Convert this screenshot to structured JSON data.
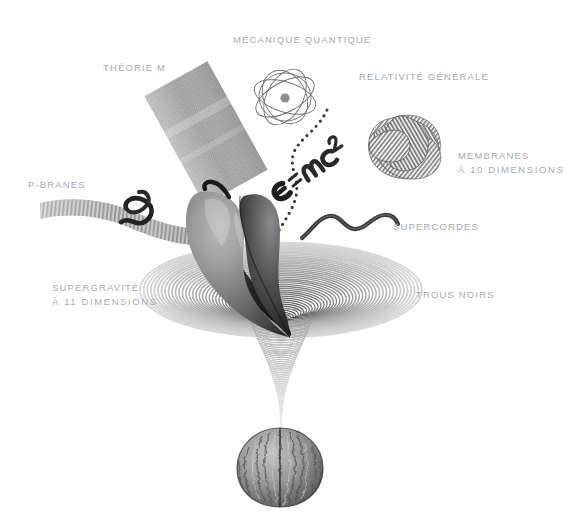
{
  "figure": {
    "type": "scientific-illustration",
    "background_color": "#ffffff",
    "label_color": "#a9a9ab"
  },
  "labels": [
    {
      "id": "theorie-m",
      "text": "THÉORIE M",
      "text2": ""
    },
    {
      "id": "mecanique",
      "text": "MÉCANIQUE QUANTIQUE",
      "text2": ""
    },
    {
      "id": "relativite",
      "text": "RELATIVITÉ GÉNÉRALE",
      "text2": ""
    },
    {
      "id": "membranes",
      "text": "MEMBRANES",
      "text2": "À 10 DIMENSIONS"
    },
    {
      "id": "p-branes",
      "text": "P-BRANES",
      "text2": ""
    },
    {
      "id": "supercordes",
      "text": "SUPERCORDES",
      "text2": ""
    },
    {
      "id": "supergravite",
      "text": "SUPERGRAVITÉ",
      "text2": "À 11 DIMENSIONS"
    },
    {
      "id": "trous-noirs",
      "text": "TROUS NOIRS",
      "text2": ""
    }
  ],
  "formula": {
    "parts": [
      "E",
      "=",
      "mc",
      "2"
    ],
    "full": "E=mc2",
    "style": "handwritten-rotated"
  },
  "objects": {
    "apple": "apple-teardrop-morph",
    "walnut": "walnut-nut",
    "knot": "striped-torus-knot",
    "atom": "atom-orbits",
    "brane_panel": "mesh-membrane-panel",
    "ribbon": "striped-ribbon-brane",
    "string": "wavy-superstring",
    "vortex": "concentric-gravity-well",
    "trajectory": "dotted-trajectory-curve"
  }
}
